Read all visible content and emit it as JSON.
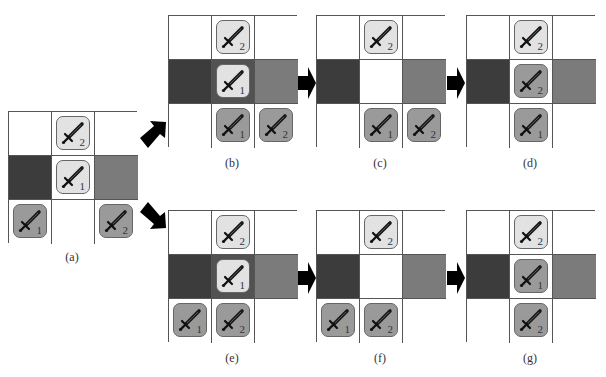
{
  "figure": {
    "panels": [
      {
        "id": "a",
        "label": "(a)",
        "x": 8,
        "y": 111,
        "cells": [
          {
            "bg": "white"
          },
          {
            "bg": "white",
            "tile": {
              "tone": "light",
              "num": "2"
            }
          },
          {
            "bg": "white"
          },
          {
            "bg": "dark"
          },
          {
            "bg": "white",
            "tile": {
              "tone": "light",
              "num": "1"
            }
          },
          {
            "bg": "mid"
          },
          {
            "bg": "white",
            "tile": {
              "tone": "grey",
              "num": "1"
            }
          },
          {
            "bg": "white"
          },
          {
            "bg": "white",
            "tile": {
              "tone": "grey",
              "num": "2"
            }
          }
        ]
      },
      {
        "id": "b",
        "label": "(b)",
        "x": 168,
        "y": 15,
        "cells": [
          {
            "bg": "white"
          },
          {
            "bg": "white",
            "tile": {
              "tone": "light",
              "num": "2"
            }
          },
          {
            "bg": "white"
          },
          {
            "bg": "dark"
          },
          {
            "bg": "center-dark",
            "tile": {
              "tone": "light",
              "num": "1"
            }
          },
          {
            "bg": "mid"
          },
          {
            "bg": "white"
          },
          {
            "bg": "white",
            "tile": {
              "tone": "grey",
              "num": "1"
            }
          },
          {
            "bg": "white",
            "tile": {
              "tone": "grey",
              "num": "2"
            }
          }
        ]
      },
      {
        "id": "c",
        "label": "(c)",
        "x": 316,
        "y": 15,
        "cells": [
          {
            "bg": "white"
          },
          {
            "bg": "white",
            "tile": {
              "tone": "light",
              "num": "2"
            }
          },
          {
            "bg": "white"
          },
          {
            "bg": "dark"
          },
          {
            "bg": "white"
          },
          {
            "bg": "mid"
          },
          {
            "bg": "white"
          },
          {
            "bg": "white",
            "tile": {
              "tone": "grey",
              "num": "1"
            }
          },
          {
            "bg": "white",
            "tile": {
              "tone": "grey",
              "num": "2"
            }
          }
        ]
      },
      {
        "id": "d",
        "label": "(d)",
        "x": 466,
        "y": 15,
        "cells": [
          {
            "bg": "white"
          },
          {
            "bg": "white",
            "tile": {
              "tone": "light",
              "num": "2"
            }
          },
          {
            "bg": "white"
          },
          {
            "bg": "dark"
          },
          {
            "bg": "white",
            "tile": {
              "tone": "grey",
              "num": "2"
            }
          },
          {
            "bg": "mid"
          },
          {
            "bg": "white"
          },
          {
            "bg": "white",
            "tile": {
              "tone": "grey",
              "num": "1"
            }
          },
          {
            "bg": "white"
          }
        ]
      },
      {
        "id": "e",
        "label": "(e)",
        "x": 168,
        "y": 210,
        "cells": [
          {
            "bg": "white"
          },
          {
            "bg": "white",
            "tile": {
              "tone": "light",
              "num": "2"
            }
          },
          {
            "bg": "white"
          },
          {
            "bg": "dark"
          },
          {
            "bg": "center-dark",
            "tile": {
              "tone": "light",
              "num": "1"
            }
          },
          {
            "bg": "mid"
          },
          {
            "bg": "white",
            "tile": {
              "tone": "grey",
              "num": "1"
            }
          },
          {
            "bg": "white",
            "tile": {
              "tone": "grey",
              "num": "2"
            }
          },
          {
            "bg": "white"
          }
        ]
      },
      {
        "id": "f",
        "label": "(f)",
        "x": 316,
        "y": 210,
        "cells": [
          {
            "bg": "white"
          },
          {
            "bg": "white",
            "tile": {
              "tone": "light",
              "num": "2"
            }
          },
          {
            "bg": "white"
          },
          {
            "bg": "dark"
          },
          {
            "bg": "white"
          },
          {
            "bg": "mid"
          },
          {
            "bg": "white",
            "tile": {
              "tone": "grey",
              "num": "1"
            }
          },
          {
            "bg": "white",
            "tile": {
              "tone": "grey",
              "num": "2"
            }
          },
          {
            "bg": "white"
          }
        ]
      },
      {
        "id": "g",
        "label": "(g)",
        "x": 466,
        "y": 210,
        "cells": [
          {
            "bg": "white"
          },
          {
            "bg": "white",
            "tile": {
              "tone": "light",
              "num": "2"
            }
          },
          {
            "bg": "white"
          },
          {
            "bg": "dark"
          },
          {
            "bg": "white",
            "tile": {
              "tone": "grey",
              "num": "1"
            }
          },
          {
            "bg": "mid"
          },
          {
            "bg": "white"
          },
          {
            "bg": "white",
            "tile": {
              "tone": "grey",
              "num": "2"
            }
          },
          {
            "bg": "white"
          }
        ]
      }
    ],
    "labels": {
      "a": "(a)",
      "b": "(b)",
      "c": "(c)",
      "d": "(d)",
      "e": "(e)",
      "f": "(f)",
      "g": "(g)"
    },
    "colors": {
      "white": "#ffffff",
      "dark": "#3c3c3c",
      "mid": "#7b7b7b",
      "center-dark": "#525252",
      "tile_light": "#e2e2e2",
      "tile_grey": "#9a9a9a",
      "arrow": "#000000"
    }
  }
}
